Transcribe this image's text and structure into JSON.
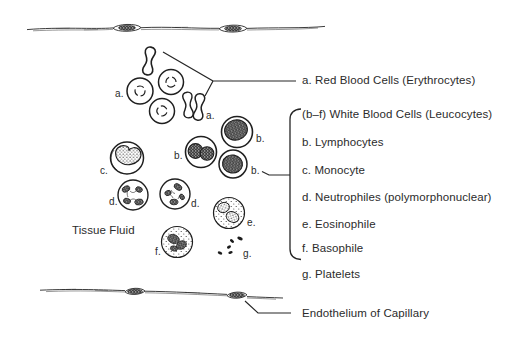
{
  "diagram": {
    "background": "#ffffff",
    "ink": "#2b2b2b",
    "annotations": {
      "tissue_fluid": "Tissue Fluid",
      "endothelium_of_capillary": "Endothelium of Capillary"
    },
    "markers": {
      "a": "a.",
      "b": "b.",
      "c": "c.",
      "d": "d.",
      "e": "e.",
      "f": "f.",
      "g": "g."
    },
    "legend": [
      "a. Red Blood Cells (Erythrocytes)",
      "(b–f) White Blood Cells (Leucocytes)",
      "b. Lymphocytes",
      "c. Monocyte",
      "d. Neutrophiles (polymorphonuclear)",
      "e. Eosinophile",
      "f. Basophile",
      "g. Platelets"
    ]
  }
}
